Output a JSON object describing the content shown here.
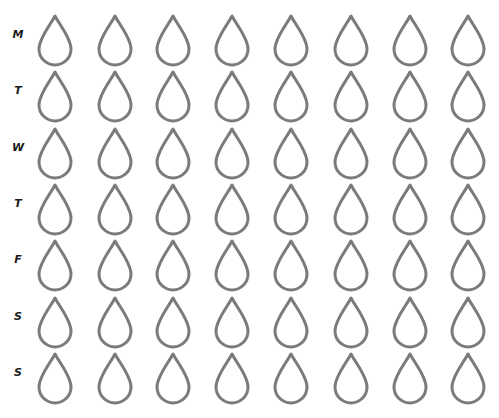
{
  "tracker": {
    "days": [
      "M",
      "T",
      "W",
      "T",
      "F",
      "S",
      "S"
    ],
    "drops_per_day": 8,
    "drop_icon": "water-drop-outline-icon",
    "stroke_color": "#7b7b7b",
    "label_color": "#1a1a1a"
  }
}
